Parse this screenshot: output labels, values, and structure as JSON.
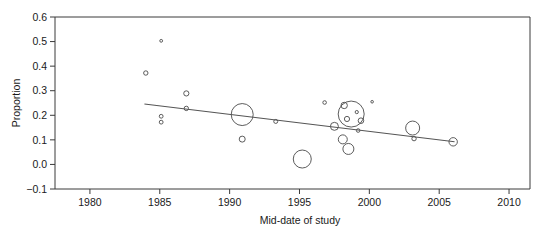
{
  "chart_data": {
    "type": "scatter",
    "title": "",
    "subtitle": "",
    "xlabel": "Mid-date of study",
    "ylabel": "Proportion",
    "xlim": [
      1977.5,
      2011.5
    ],
    "ylim": [
      -0.1,
      0.6
    ],
    "xticks": [
      1980,
      1985,
      1990,
      1995,
      2000,
      2005,
      2010
    ],
    "xtick_labels": [
      "1980",
      "1985",
      "1990",
      "1995",
      "2000",
      "2005",
      "2010"
    ],
    "yticks": [
      -0.1,
      0.0,
      0.1,
      0.2,
      0.3,
      0.4,
      0.5,
      0.6
    ],
    "ytick_labels": [
      "-0.1",
      "0.0",
      "0.1",
      "0.2",
      "0.3",
      "0.4",
      "0.5",
      "0.6"
    ],
    "grid": false,
    "legend": "none",
    "marker": "open-circle",
    "size_encoding": "study weight (bubble area)",
    "colors": {
      "axis": "#3a3a3a",
      "marker_stroke": "#4a4a4a",
      "trend_line": "#555555",
      "background": "#ffffff"
    },
    "points": [
      {
        "x": 1984.0,
        "y": 0.372,
        "size": 2.2
      },
      {
        "x": 1985.1,
        "y": 0.503,
        "size": 1.4
      },
      {
        "x": 1985.1,
        "y": 0.196,
        "size": 1.9
      },
      {
        "x": 1985.1,
        "y": 0.172,
        "size": 1.9
      },
      {
        "x": 1986.9,
        "y": 0.289,
        "size": 2.6
      },
      {
        "x": 1986.9,
        "y": 0.228,
        "size": 2.2
      },
      {
        "x": 1990.9,
        "y": 0.203,
        "size": 11.0
      },
      {
        "x": 1990.9,
        "y": 0.103,
        "size": 3.0
      },
      {
        "x": 1993.3,
        "y": 0.175,
        "size": 2.0
      },
      {
        "x": 1995.2,
        "y": 0.022,
        "size": 9.0
      },
      {
        "x": 1996.8,
        "y": 0.252,
        "size": 1.8
      },
      {
        "x": 1997.5,
        "y": 0.155,
        "size": 4.0
      },
      {
        "x": 1998.1,
        "y": 0.102,
        "size": 4.5
      },
      {
        "x": 1998.5,
        "y": 0.063,
        "size": 5.5
      },
      {
        "x": 1998.2,
        "y": 0.24,
        "size": 3.2
      },
      {
        "x": 1998.7,
        "y": 0.205,
        "size": 13.0
      },
      {
        "x": 1998.4,
        "y": 0.185,
        "size": 2.6
      },
      {
        "x": 1999.4,
        "y": 0.178,
        "size": 2.8
      },
      {
        "x": 1999.2,
        "y": 0.138,
        "size": 1.8
      },
      {
        "x": 1999.1,
        "y": 0.213,
        "size": 1.6
      },
      {
        "x": 2000.2,
        "y": 0.255,
        "size": 1.3
      },
      {
        "x": 2003.1,
        "y": 0.148,
        "size": 7.0
      },
      {
        "x": 2003.2,
        "y": 0.105,
        "size": 2.2
      },
      {
        "x": 2006.0,
        "y": 0.092,
        "size": 4.2
      }
    ],
    "trend_line": {
      "x_start": 1983.9,
      "y_start": 0.246,
      "x_end": 2006.1,
      "y_end": 0.092,
      "description": "fitted meta-regression line, negative slope"
    }
  }
}
